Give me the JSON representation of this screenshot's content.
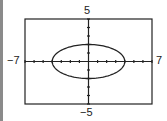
{
  "chart_data": {
    "type": "line",
    "title": "",
    "xlabel": "",
    "ylabel": "",
    "xlim": [
      -7,
      7
    ],
    "ylim": [
      -5,
      5
    ],
    "grid": false,
    "tick_step": 1,
    "window_labels": {
      "xmin": "−7",
      "xmax": "7",
      "ymin": "−5",
      "ymax": "5"
    },
    "series": [
      {
        "name": "ellipse",
        "equation": "x^2/16 + y^2/4 = 1",
        "center": [
          0,
          0
        ],
        "semi_major_x": 4,
        "semi_minor_y": 2
      }
    ]
  },
  "colors": {
    "curve": "#222222",
    "axes": "#222222",
    "frame": "#222222",
    "background": "#ffffff"
  }
}
